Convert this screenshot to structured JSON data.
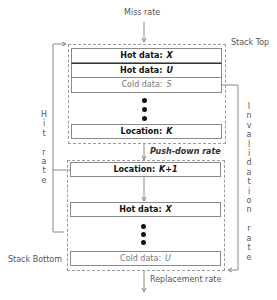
{
  "labels": {
    "miss_rate": "Miss rate",
    "stack_top": "Stack Top",
    "stack_bottom": "Stack Bottom",
    "push_down_rate": "Push-down rate",
    "replacement_rate": "Replacement rate",
    "hit_rate": "Hit rate",
    "invalidation_rate": "Invalidation rate"
  },
  "upper_stack": {
    "cells": [
      {
        "prefix": "Hot data:",
        "var": "X",
        "kind": "hot"
      },
      {
        "prefix": "Hot data:",
        "var": "U",
        "kind": "hot"
      },
      {
        "prefix": "Cold data:",
        "var": "S",
        "kind": "cold"
      },
      {
        "prefix": "Location:",
        "var": "K",
        "kind": "hot"
      }
    ]
  },
  "lower_stack": {
    "cells": [
      {
        "prefix": "Location:",
        "var": "K+1",
        "kind": "hot"
      },
      {
        "prefix": "Hot data:",
        "var": "X",
        "kind": "hot"
      },
      {
        "prefix": "Cold data:",
        "var": "U",
        "kind": "cold"
      }
    ]
  },
  "colors": {
    "line": "#8a8a8a",
    "dashed": "#9a9a9a",
    "dot": "#111111"
  }
}
